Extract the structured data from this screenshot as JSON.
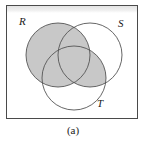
{
  "figure": {
    "caption": "(a)",
    "kind": "venn-diagram",
    "set_count": 3,
    "shaded_expression": "R ∪ (S ∩ T)",
    "shaded_regions": [
      "R only",
      "R ∩ S only",
      "R ∩ T only",
      "R ∩ S ∩ T",
      "S ∩ T only"
    ],
    "unshaded_regions": [
      "S only",
      "T only",
      "outside all sets"
    ]
  },
  "colors": {
    "shade_fill": "#c8c8c8",
    "circle_stroke": "#555555",
    "box_stroke": "#4a4a4a",
    "box_fill": "#ffffff",
    "page_background": "#ffffff",
    "label_text": "#1a1a1a",
    "top_band": "#e3e3e3"
  },
  "universal_set_box": {
    "x": 6,
    "y": 5,
    "width": 132,
    "height": 114
  },
  "sets": [
    {
      "name": "R",
      "label": "R",
      "cx": 58,
      "cy": 55,
      "r": 32,
      "filled": true,
      "label_x": 19,
      "label_y": 16
    },
    {
      "name": "S",
      "label": "S",
      "cx": 90,
      "cy": 55,
      "r": 32,
      "filled": false,
      "label_x": 118,
      "label_y": 18
    },
    {
      "name": "T",
      "label": "T",
      "cx": 74,
      "cy": 78,
      "r": 32,
      "filled": false,
      "label_x": 97,
      "label_y": 98
    }
  ]
}
